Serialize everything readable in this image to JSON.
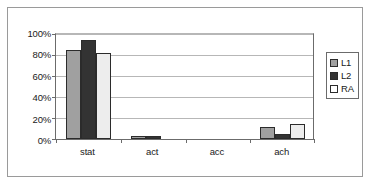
{
  "chart_data": {
    "type": "bar",
    "title": "",
    "xlabel": "",
    "ylabel": "",
    "categories": [
      "stat",
      "act",
      "acc",
      "ach"
    ],
    "series": [
      {
        "name": "L1",
        "color": "#a0a0a0",
        "values": [
          85,
          3,
          0,
          11
        ]
      },
      {
        "name": "L2",
        "color": "#333333",
        "values": [
          94,
          3,
          0,
          5
        ]
      },
      {
        "name": "RA",
        "color": "#ffffff",
        "values": [
          82,
          0,
          0,
          14
        ]
      }
    ],
    "ylim": [
      0,
      100
    ],
    "ytick_values": [
      0,
      20,
      40,
      60,
      80,
      100
    ],
    "ytick_labels": [
      "0%",
      "20%",
      "40%",
      "60%",
      "80%",
      "100%"
    ],
    "grid": true,
    "legend_position": "right",
    "value_format": "percent"
  },
  "legend": {
    "items": [
      {
        "label": "L1"
      },
      {
        "label": "L2"
      },
      {
        "label": "RA"
      }
    ]
  },
  "axes": {
    "y_tick_labels": [
      "100%",
      "80%",
      "60%",
      "40%",
      "20%",
      "0%"
    ],
    "x_tick_labels": [
      "stat",
      "act",
      "acc",
      "ach"
    ]
  }
}
